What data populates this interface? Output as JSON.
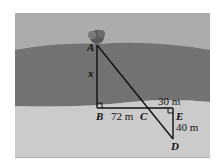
{
  "diagram": {
    "points": {
      "A": {
        "label": "A"
      },
      "B": {
        "label": "B"
      },
      "C": {
        "label": "C"
      },
      "D": {
        "label": "D"
      },
      "E": {
        "label": "E"
      }
    },
    "measures": {
      "AB": "x",
      "BC": "72 m",
      "CE": "30 m",
      "ED": "40 m"
    },
    "colors": {
      "far_bank": "#a9a9a9",
      "river": "#6f6f6f",
      "near_bank": "#c8c8c8",
      "lines": "#111111"
    }
  }
}
